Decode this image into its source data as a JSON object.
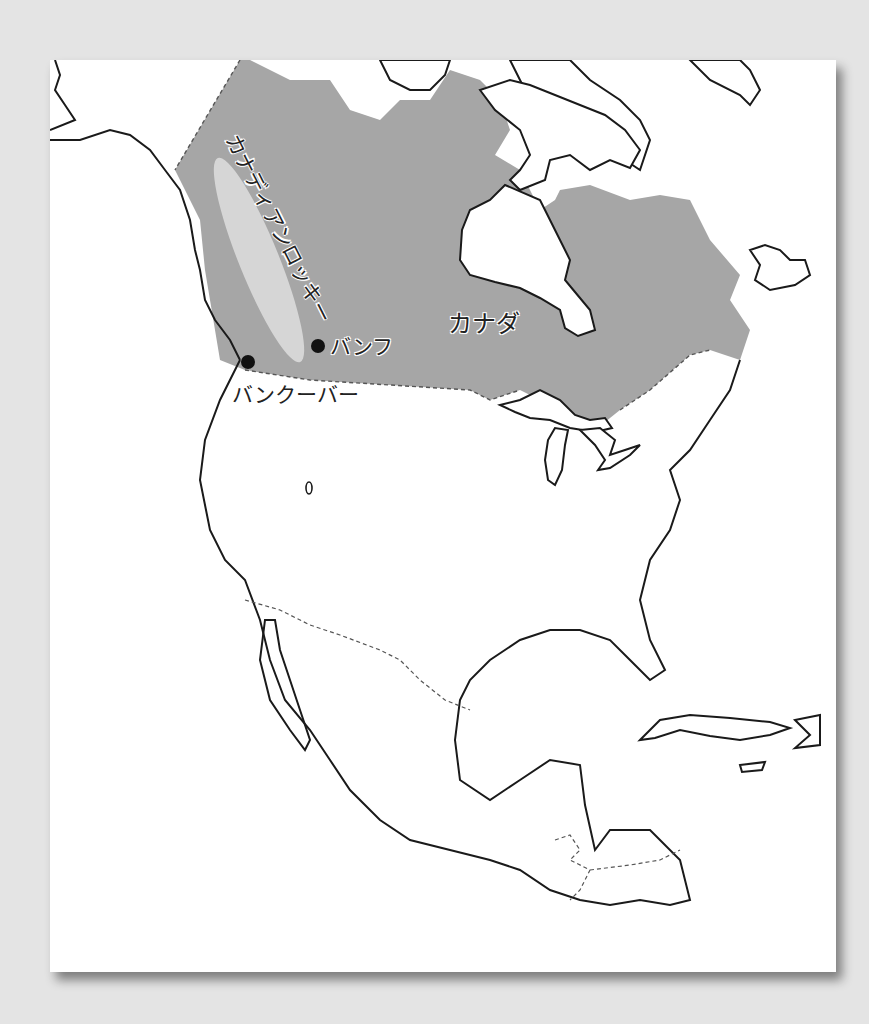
{
  "map": {
    "title": "",
    "region": "North America",
    "highlighted_country": "Canada",
    "colors": {
      "background": "#e4e4e4",
      "card": "#ffffff",
      "canada_fill": "#a6a6a6",
      "rockies_fill": "#d6d6d6",
      "coastline": "#1a1a1a",
      "border_dashed": "#555555"
    },
    "labels": {
      "country": "カナダ",
      "mountain_range": "カナディアンロッキー",
      "city_banff": "バンフ",
      "city_vancouver": "バンクーバー"
    },
    "markers": [
      {
        "name": "バンフ",
        "type": "city-dot"
      },
      {
        "name": "バンクーバー",
        "type": "city-dot"
      }
    ]
  }
}
